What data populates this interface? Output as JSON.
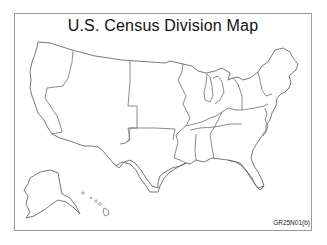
{
  "map": {
    "title": "U.S. Census Division Map",
    "figure_code": "GR25N01(b)",
    "divisions": [
      "Pacific",
      "Mountain",
      "West North Central",
      "West South Central",
      "East North Central",
      "East South Central",
      "South Atlantic",
      "Middle Atlantic",
      "New England"
    ],
    "insets": [
      "Alaska",
      "Hawaii"
    ],
    "colors": {
      "outline": "#6e6e6e",
      "frame": "#9a9a9a",
      "background": "#ffffff"
    }
  }
}
